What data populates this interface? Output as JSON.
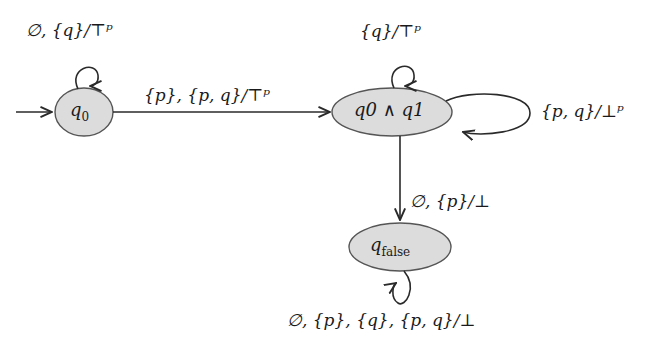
{
  "diagram": {
    "type": "state-machine",
    "colors": {
      "node_fill": "#dcdcdc",
      "stroke": "#2a2a2a",
      "text": "#1a1a1a",
      "background": "#ffffff"
    },
    "nodes": [
      {
        "id": "q0",
        "label_main": "q",
        "label_sub": "0",
        "initial": true
      },
      {
        "id": "q0_and_q1",
        "label": "q0 ∧ q1"
      },
      {
        "id": "qfalse",
        "label_main": "q",
        "label_sub": "false"
      }
    ],
    "edges": [
      {
        "from": "q0",
        "to": "q0",
        "label": "∅, {q}/⊤ᵖ"
      },
      {
        "from": "q0",
        "to": "q0_and_q1",
        "label": "{p}, {p, q}/⊤ᵖ"
      },
      {
        "from": "q0_and_q1",
        "to": "q0_and_q1",
        "position": "top",
        "label": "{q}/⊤ᵖ"
      },
      {
        "from": "q0_and_q1",
        "to": "q0_and_q1",
        "position": "right",
        "label": "{p, q}/⊥ᵖ"
      },
      {
        "from": "q0_and_q1",
        "to": "qfalse",
        "label": "∅, {p}/⊥"
      },
      {
        "from": "qfalse",
        "to": "qfalse",
        "label": "∅, {p}, {q}, {p, q}/⊥"
      }
    ]
  }
}
